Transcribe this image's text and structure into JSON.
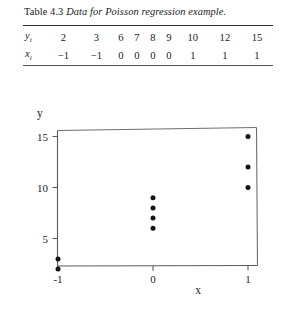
{
  "table": {
    "caption_label": "Table 4.3",
    "caption_title": "Data for Poisson regression example.",
    "rows": [
      {
        "label": "y",
        "subscript": "i",
        "values": [
          "2",
          "3",
          "6",
          "7",
          "8",
          "9",
          "10",
          "12",
          "15"
        ]
      },
      {
        "label": "x",
        "subscript": "i",
        "values": [
          "−1",
          "−1",
          "0",
          "0",
          "0",
          "0",
          "1",
          "1",
          "1"
        ]
      }
    ]
  },
  "chart_data": {
    "type": "scatter",
    "title": "",
    "xlabel": "x",
    "ylabel": "y",
    "x": [
      -1,
      -1,
      0,
      0,
      0,
      0,
      1,
      1,
      1
    ],
    "y": [
      2,
      3,
      6,
      7,
      8,
      9,
      10,
      12,
      15
    ],
    "points": [
      {
        "x": -1,
        "y": 2
      },
      {
        "x": -1,
        "y": 3
      },
      {
        "x": 0,
        "y": 6
      },
      {
        "x": 0,
        "y": 7
      },
      {
        "x": 0,
        "y": 8
      },
      {
        "x": 0,
        "y": 9
      },
      {
        "x": 1,
        "y": 10
      },
      {
        "x": 1,
        "y": 12
      },
      {
        "x": 1,
        "y": 15
      }
    ],
    "xticks": [
      -1,
      0,
      1
    ],
    "xtick_labels": [
      "-1",
      "0",
      "1"
    ],
    "yticks": [
      5,
      10,
      15
    ],
    "ytick_labels": [
      "5",
      "10",
      "15"
    ],
    "xlim": [
      -1.25,
      1.1
    ],
    "ylim": [
      0.8,
      15.6
    ],
    "grid": false,
    "legend": "none",
    "marker": "filled-circle",
    "marker_color": "#141414"
  },
  "colors": {
    "background": "#ffffff",
    "ink": "#1a1a1a",
    "rule": "#2c2c2c",
    "axis": "#5a5a5a"
  }
}
